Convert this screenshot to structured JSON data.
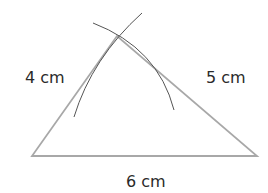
{
  "diagram": {
    "sides": [
      {
        "name": "left",
        "label": "4 cm"
      },
      {
        "name": "right",
        "label": "5 cm"
      },
      {
        "name": "base",
        "label": "6 cm"
      }
    ],
    "colors": {
      "triangle": "#a0a0a0",
      "arc": "#555555",
      "text": "#2a2a2a"
    }
  }
}
